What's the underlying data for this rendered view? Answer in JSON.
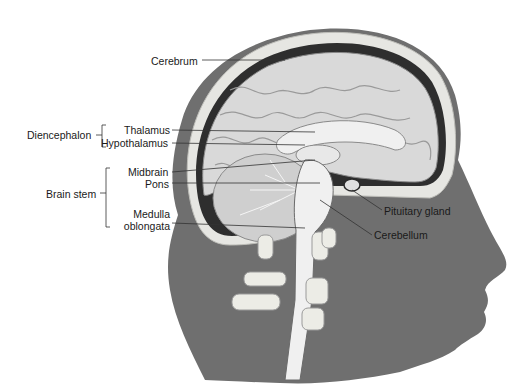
{
  "figure": {
    "colors": {
      "head": "#6f6f6f",
      "bone": "#e6e6e2",
      "brain": "#d9d9d9",
      "brain_light": "#f0f0f0",
      "dark_line": "#2a2a2a",
      "label": "#1a1a1a",
      "background": "#ffffff"
    }
  },
  "labels": {
    "cerebrum": "Cerebrum",
    "diencephalon": "Diencephalon",
    "thalamus": "Thalamus",
    "hypothalamus": "Hypothalamus",
    "brain_stem": "Brain stem",
    "midbrain": "Midbrain",
    "pons": "Pons",
    "medulla_line1": "Medulla",
    "medulla_line2": "oblongata",
    "pituitary_gland": "Pituitary gland",
    "cerebellum": "Cerebellum"
  }
}
